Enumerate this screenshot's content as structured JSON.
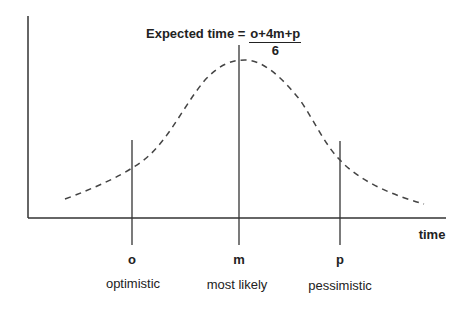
{
  "formula": {
    "lhs": "Expected time =",
    "numerator": "o+4m+p",
    "denominator": "6"
  },
  "axes": {
    "x_label": "time"
  },
  "markers": [
    {
      "symbol": "o",
      "description": "optimistic"
    },
    {
      "symbol": "m",
      "description": "most likely"
    },
    {
      "symbol": "p",
      "description": "pessimistic"
    }
  ],
  "colors": {
    "line": "#333333",
    "curve": "#444444"
  }
}
